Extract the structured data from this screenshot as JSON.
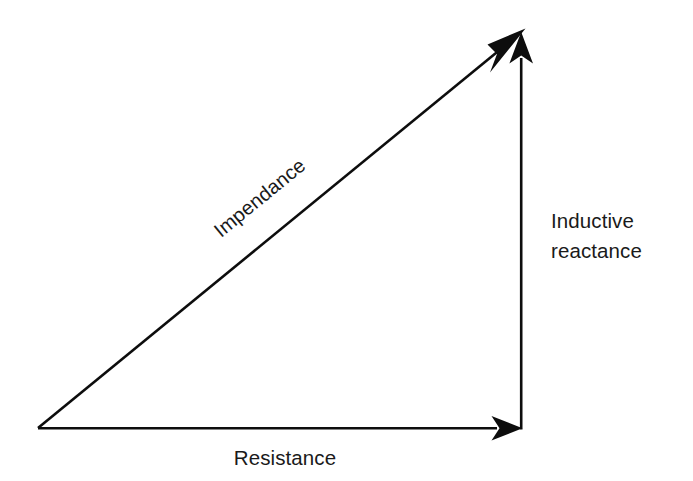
{
  "diagram": {
    "background_color": "#ffffff",
    "stroke_color": "#0d0d0d",
    "text_color": "#1a1a1a",
    "labels": {
      "hypotenuse": "Impendance",
      "vertical_line_1": "Inductive",
      "vertical_line_2": "reactance",
      "horizontal": "Resistance"
    },
    "vectors": [
      {
        "name": "impendance-vector",
        "label": "Impendance",
        "from": [
          38,
          428
        ],
        "to": [
          524,
          30
        ],
        "arrowhead": "end",
        "orientation": "diagonal"
      },
      {
        "name": "inductive-reactance-vector",
        "label": "Inductive reactance",
        "from": [
          521,
          428
        ],
        "to": [
          521,
          33
        ],
        "arrowhead": "end",
        "orientation": "vertical"
      },
      {
        "name": "resistance-vector",
        "label": "Resistance",
        "from": [
          38,
          428
        ],
        "to": [
          522,
          428
        ],
        "arrowhead": "end",
        "orientation": "horizontal"
      }
    ],
    "label_positions": {
      "impendance": {
        "x": 264,
        "y": 203,
        "rotation_deg": -39.3
      },
      "inductive_reactance": {
        "x": 551,
        "y": 228
      },
      "resistance": {
        "x": 285,
        "y": 465
      }
    }
  }
}
